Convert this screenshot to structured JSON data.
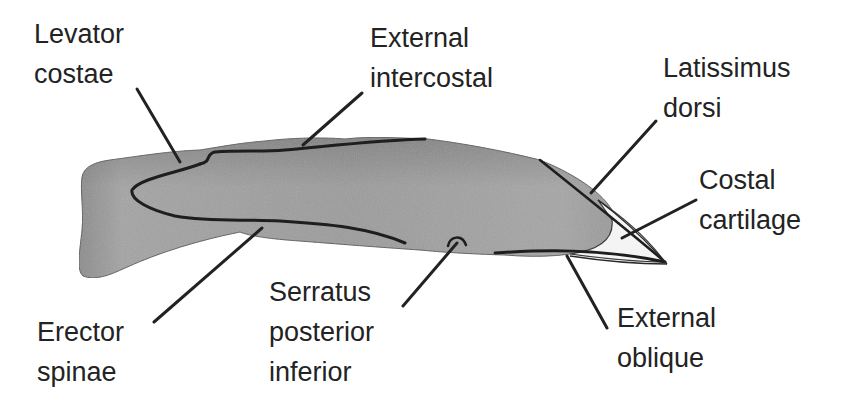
{
  "diagram": {
    "colors": {
      "bone_fill": "#9a9a9a",
      "bone_shade": "#7d7d7d",
      "outline": "#1e1e1e",
      "leader": "#222222",
      "text": "#232323",
      "background": "#ffffff"
    },
    "labels": [
      {
        "id": "levator-costae",
        "lines": [
          "Levator",
          "costae"
        ]
      },
      {
        "id": "external-intercostal",
        "lines": [
          "External",
          "intercostal"
        ]
      },
      {
        "id": "latissimus-dorsi",
        "lines": [
          "Latissimus",
          "dorsi"
        ]
      },
      {
        "id": "costal-cartilage",
        "lines": [
          "Costal",
          "cartilage"
        ]
      },
      {
        "id": "erector-spinae",
        "lines": [
          "Erector",
          "spinae"
        ]
      },
      {
        "id": "serratus-posterior-inferior",
        "lines": [
          "Serratus",
          "posterior",
          "inferior"
        ]
      },
      {
        "id": "external-oblique",
        "lines": [
          "External",
          "oblique"
        ]
      }
    ]
  }
}
